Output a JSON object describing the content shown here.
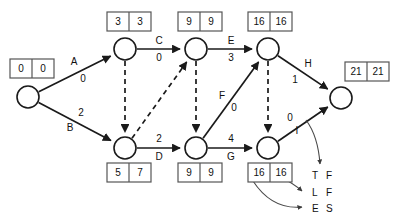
{
  "diagram": {
    "type": "network-diagram",
    "canvas": {
      "width": 400,
      "height": 219
    },
    "colors": {
      "stroke": "#1a1a1a",
      "box_stroke": "#555555",
      "background": "#ffffff",
      "callout": "#4a4a4a"
    },
    "nodes": [
      {
        "id": "n1",
        "x": 28,
        "y": 97,
        "r": 11
      },
      {
        "id": "n2",
        "x": 125,
        "y": 49,
        "r": 11
      },
      {
        "id": "n3",
        "x": 196,
        "y": 49,
        "r": 11
      },
      {
        "id": "n4",
        "x": 268,
        "y": 49,
        "r": 11
      },
      {
        "id": "n5",
        "x": 125,
        "y": 148,
        "r": 11
      },
      {
        "id": "n6",
        "x": 196,
        "y": 148,
        "r": 11
      },
      {
        "id": "n7",
        "x": 268,
        "y": 148,
        "r": 11
      },
      {
        "id": "n8",
        "x": 341,
        "y": 98,
        "r": 11
      }
    ],
    "edges": [
      {
        "id": "A",
        "from": "n1",
        "to": "n2",
        "style": "solid",
        "name": "A",
        "duration": "0",
        "name_x": 74,
        "name_y": 62,
        "dur_x": 83,
        "dur_y": 79
      },
      {
        "id": "B",
        "from": "n1",
        "to": "n5",
        "style": "solid",
        "name": "B",
        "duration": "2",
        "name_x": 70,
        "name_y": 128,
        "dur_x": 81,
        "dur_y": 113
      },
      {
        "id": "C",
        "from": "n2",
        "to": "n3",
        "style": "solid",
        "name": "C",
        "duration": "0",
        "name_x": 159,
        "name_y": 41,
        "dur_x": 159,
        "dur_y": 58
      },
      {
        "id": "E",
        "from": "n3",
        "to": "n4",
        "style": "solid",
        "name": "E",
        "duration": "3",
        "name_x": 231,
        "name_y": 41,
        "dur_x": 231,
        "dur_y": 58
      },
      {
        "id": "H",
        "from": "n4",
        "to": "n8",
        "style": "solid",
        "name": "H",
        "duration": "1",
        "name_x": 308,
        "name_y": 64,
        "dur_x": 295,
        "dur_y": 80
      },
      {
        "id": "D",
        "from": "n5",
        "to": "n6",
        "style": "solid",
        "name": "D",
        "duration": "2",
        "name_x": 159,
        "name_y": 157,
        "dur_x": 159,
        "dur_y": 139
      },
      {
        "id": "G",
        "from": "n6",
        "to": "n7",
        "style": "solid",
        "name": "G",
        "duration": "4",
        "name_x": 231,
        "name_y": 157,
        "dur_x": 231,
        "dur_y": 139
      },
      {
        "id": "F",
        "from": "n6",
        "to": "n4",
        "style": "solid",
        "name": "F",
        "duration": "0",
        "name_x": 222,
        "name_y": 96,
        "dur_x": 234,
        "dur_y": 108
      },
      {
        "id": "I",
        "from": "n7",
        "to": "n8",
        "style": "solid",
        "name": "I",
        "duration": "0",
        "name_x": 297,
        "name_y": 131,
        "dur_x": 290,
        "dur_y": 118
      }
    ],
    "dummy_edges": [
      {
        "id": "d1",
        "from": "n2",
        "to": "n5",
        "style": "dashed"
      },
      {
        "id": "d2",
        "from": "n5",
        "to": "n3",
        "style": "dashed"
      },
      {
        "id": "d3",
        "from": "n3",
        "to": "n6",
        "style": "dashed"
      },
      {
        "id": "d4",
        "from": "n4",
        "to": "n7",
        "style": "dashed"
      }
    ],
    "time_boxes": [
      {
        "id": "b1",
        "for_node": "n1",
        "x": 10,
        "y": 59,
        "left": "0",
        "right": "0"
      },
      {
        "id": "b2",
        "for_node": "n2",
        "x": 107,
        "y": 12,
        "left": "3",
        "right": "3"
      },
      {
        "id": "b3",
        "for_node": "n3",
        "x": 178,
        "y": 12,
        "left": "9",
        "right": "9"
      },
      {
        "id": "b4",
        "for_node": "n4",
        "x": 248,
        "y": 12,
        "left": "16",
        "right": "16"
      },
      {
        "id": "b5",
        "for_node": "n8",
        "x": 345,
        "y": 62,
        "left": "21",
        "right": "21"
      },
      {
        "id": "b6",
        "for_node": "n5",
        "x": 107,
        "y": 163,
        "left": "5",
        "right": "7"
      },
      {
        "id": "b7",
        "for_node": "n6",
        "x": 178,
        "y": 163,
        "left": "9",
        "right": "9"
      },
      {
        "id": "b8",
        "for_node": "n7",
        "x": 248,
        "y": 163,
        "left": "16",
        "right": "16"
      }
    ],
    "box_size": {
      "w": 44,
      "h": 19
    },
    "legend": [
      {
        "id": "tf",
        "label_a": "T",
        "label_b": "F",
        "x": 312,
        "y": 176
      },
      {
        "id": "lf",
        "label_a": "L",
        "label_b": "F",
        "x": 312,
        "y": 193
      },
      {
        "id": "es",
        "label_a": "E",
        "label_b": "S",
        "x": 312,
        "y": 209
      }
    ],
    "callouts": [
      {
        "id": "callout-tf",
        "path": "M 306 120 Q 318 136 320 164",
        "target": "tf"
      },
      {
        "id": "callout-lf",
        "path": "M 280 177 Q 293 183 302 191",
        "target": "lf"
      },
      {
        "id": "callout-es",
        "path": "M 253 181 Q 272 210 302 207",
        "target": "es"
      }
    ]
  }
}
